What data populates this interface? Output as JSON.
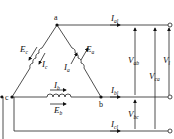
{
  "diagram": {
    "type": "delta-connected three-phase source",
    "nodes": [
      "a",
      "b",
      "c"
    ],
    "windings": [
      {
        "emf": "E",
        "emf_sub": "c",
        "current": "I",
        "current_sub": "c",
        "branch": "a-c"
      },
      {
        "emf": "E",
        "emf_sub": "a",
        "current": "I",
        "current_sub": "a",
        "branch": "a-b"
      },
      {
        "emf": "E",
        "emf_sub": "b",
        "current": "I",
        "current_sub": "b",
        "branch": "c-b"
      }
    ],
    "line_currents": [
      {
        "label": "I",
        "sub": "al"
      },
      {
        "label": "I",
        "sub": "bl"
      },
      {
        "label": "I",
        "sub": "cl"
      }
    ],
    "voltages": [
      {
        "label": "V",
        "sub": "ab"
      },
      {
        "label": "V",
        "sub": "ca"
      },
      {
        "label": "V",
        "sub": "l"
      },
      {
        "label": "V",
        "sub": "bc"
      }
    ]
  }
}
